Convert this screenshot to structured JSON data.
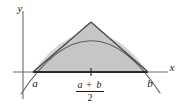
{
  "figure": {
    "background_color": "#ffffff",
    "axes": {
      "x_axis_label": "x",
      "y_axis_label": "y",
      "axis_color": "#595959"
    },
    "labels": {
      "left_endpoint": "a",
      "right_endpoint": "b",
      "midpoint_numerator_left": "a",
      "midpoint_numerator_op": "+",
      "midpoint_numerator_right": "b",
      "midpoint_denominator": "2"
    },
    "colors": {
      "segment_fill": "#d2d2d2",
      "triangle_fill": "#c4c4c4",
      "curve_stroke": "#4d4d4d",
      "chord_stroke": "#3d3d3d",
      "baseline_stroke": "#2b2b2b",
      "tick_stroke": "#2b2b2b",
      "fraction_bar": "#1a1a1a"
    },
    "geometry": {
      "y_axis_x": 23,
      "y_axis_top": 11,
      "y_axis_bottom": 99,
      "x_axis_y": 72,
      "x_axis_left": 13,
      "x_axis_right": 168,
      "point_a_x": 33,
      "point_b_x": 148,
      "apex_x": 91,
      "apex_y": 22,
      "curve_extend_left_x": 21,
      "curve_extend_left_y": 94,
      "curve_extend_right_x": 160,
      "curve_extend_right_y": 93
    }
  }
}
